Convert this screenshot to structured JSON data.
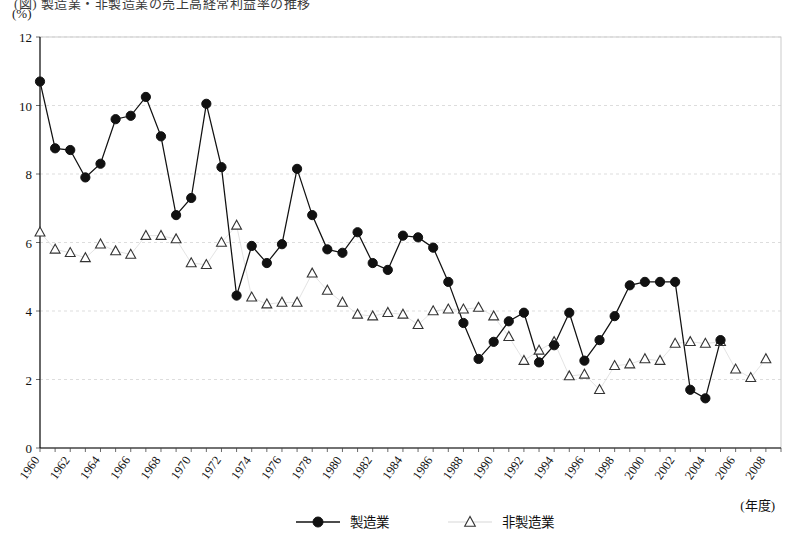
{
  "figure": {
    "clipped_title": "(図) 製造業・非製造業の売上高経常利益率の推移",
    "unit_label": "(%)",
    "xaxis_title": "(年度)"
  },
  "legend": {
    "position": "bottom-center",
    "entries": [
      {
        "label": "製造業",
        "marker": "filled-circle",
        "color": "#111111"
      },
      {
        "label": "非製造業",
        "marker": "open-triangle",
        "color": "#333333"
      }
    ]
  },
  "chart_data": {
    "type": "line",
    "title": "(図) 製造業・非製造業の売上高経常利益率の推移",
    "xlabel": "(年度)",
    "ylabel": "(%)",
    "xlim": [
      1960,
      2009
    ],
    "ylim": [
      0,
      12
    ],
    "yticks": [
      0,
      2,
      4,
      6,
      8,
      10,
      12
    ],
    "xticks": [
      1960,
      1962,
      1964,
      1966,
      1968,
      1970,
      1972,
      1974,
      1976,
      1978,
      1980,
      1982,
      1984,
      1986,
      1988,
      1990,
      1992,
      1994,
      1996,
      1998,
      2000,
      2002,
      2004,
      2006,
      2008
    ],
    "grid": true,
    "legend_position": "bottom",
    "x": [
      1960,
      1961,
      1962,
      1963,
      1964,
      1965,
      1966,
      1967,
      1968,
      1969,
      1970,
      1971,
      1972,
      1973,
      1974,
      1975,
      1976,
      1977,
      1978,
      1979,
      1980,
      1981,
      1982,
      1983,
      1984,
      1985,
      1986,
      1987,
      1988,
      1989,
      1990,
      1991,
      1992,
      1993,
      1994,
      1995,
      1996,
      1997,
      1998,
      1999,
      2000,
      2001,
      2002,
      2003,
      2004,
      2005,
      2006,
      2007,
      2008,
      2009
    ],
    "series": [
      {
        "name": "製造業",
        "marker": "filled-circle",
        "values": [
          10.7,
          8.75,
          8.7,
          7.9,
          8.3,
          9.6,
          9.7,
          10.25,
          9.1,
          6.8,
          7.3,
          10.05,
          8.2,
          4.45,
          5.9,
          5.4,
          5.95,
          8.15,
          6.8,
          5.8,
          5.7,
          6.3,
          5.4,
          5.2,
          6.2,
          6.15,
          5.85,
          4.85,
          3.65,
          2.6,
          3.1,
          3.7,
          3.95,
          2.5,
          3.0,
          3.95,
          2.55,
          3.15,
          3.85,
          4.75,
          4.85,
          4.85,
          4.85,
          1.7,
          1.45,
          3.15,
          null,
          null,
          null,
          null
        ]
      },
      {
        "name": "非製造業",
        "marker": "open-triangle",
        "values": [
          6.3,
          5.8,
          5.7,
          5.55,
          5.95,
          5.75,
          5.65,
          6.2,
          6.2,
          6.1,
          5.4,
          5.35,
          6.0,
          6.5,
          4.4,
          4.2,
          4.25,
          4.25,
          5.1,
          4.6,
          4.25,
          3.9,
          3.85,
          3.95,
          3.9,
          3.6,
          4.0,
          4.05,
          4.05,
          4.1,
          3.85,
          3.25,
          2.55,
          2.85,
          3.1,
          2.1,
          2.15,
          1.7,
          2.4,
          2.45,
          2.6,
          2.55,
          3.05,
          3.1,
          3.05,
          3.1,
          2.3,
          2.05,
          2.6,
          null
        ]
      }
    ],
    "series_note": "製造業 values are ordered 1960..2009 with the final readings 1.7 (2007), 1.45 (2008), 3.15 (2009); 非製造業 ends 2.05 (2007), 2.6 (2008)."
  }
}
